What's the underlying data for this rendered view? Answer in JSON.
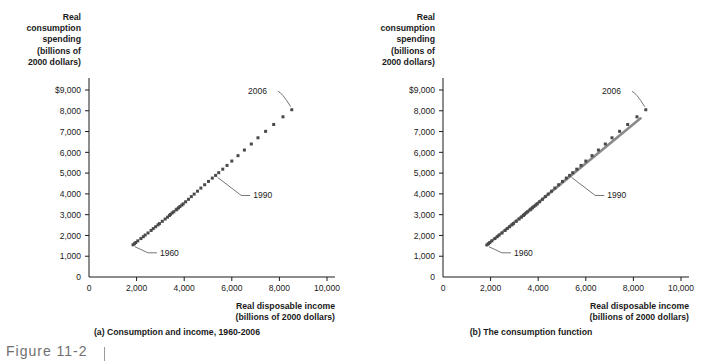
{
  "figure": {
    "number_label": "Figure 11-2"
  },
  "chart_data": [
    {
      "type": "scatter",
      "panel_id": "a",
      "title": "(a) Consumption and income, 1960-2006",
      "xlabel": "Real disposable income",
      "xlabel_units": "(billions of 2000 dollars)",
      "ylabel_lines": [
        "Real",
        "consumption",
        "spending",
        "(billions of",
        "2000 dollars)"
      ],
      "xlim": [
        0,
        10000
      ],
      "ylim": [
        0,
        9000
      ],
      "xticks": [
        0,
        2000,
        4000,
        6000,
        8000,
        10000
      ],
      "xtick_labels": [
        "0",
        "2,000",
        "4,000",
        "6,000",
        "8,000",
        "10,000"
      ],
      "yticks": [
        0,
        1000,
        2000,
        3000,
        4000,
        5000,
        6000,
        7000,
        8000,
        9000
      ],
      "ytick_labels": [
        "0",
        "1,000",
        "2,000",
        "3,000",
        "4,000",
        "5,000",
        "6,000",
        "7,000",
        "8,000",
        "$9,000"
      ],
      "grid": false,
      "legend": "none",
      "marker": "square",
      "marker_color": "#4a4a4a",
      "series": [
        {
          "name": "Real consumption spending vs. real disposable income, 1960-2006",
          "x": [
            1850,
            1910,
            1965,
            2050,
            2180,
            2280,
            2360,
            2480,
            2610,
            2700,
            2800,
            2900,
            2960,
            3080,
            3200,
            3300,
            3380,
            3420,
            3490,
            3560,
            3660,
            3700,
            3760,
            3820,
            3900,
            3960,
            4060,
            4180,
            4300,
            4420,
            4560,
            4700,
            4860,
            5020,
            5180,
            5320,
            5450,
            5620,
            5800,
            6000,
            6260,
            6530,
            6820,
            7100,
            7420,
            7760,
            8150,
            8520
          ],
          "y": [
            1550,
            1600,
            1660,
            1740,
            1850,
            1940,
            2020,
            2120,
            2240,
            2330,
            2420,
            2510,
            2570,
            2680,
            2790,
            2880,
            2960,
            3010,
            3080,
            3140,
            3230,
            3270,
            3330,
            3390,
            3460,
            3520,
            3620,
            3740,
            3870,
            3990,
            4130,
            4280,
            4440,
            4600,
            4760,
            4890,
            5020,
            5190,
            5370,
            5580,
            5840,
            6110,
            6400,
            6700,
            7010,
            7340,
            7710,
            8050
          ]
        }
      ],
      "annotations": [
        {
          "label": "1960",
          "point_x": 1850,
          "point_y": 1550,
          "text_x": 2980,
          "text_y": 1020
        },
        {
          "label": "1990",
          "point_x": 5320,
          "point_y": 4890,
          "text_x": 6900,
          "text_y": 3780
        },
        {
          "label": "2006",
          "point_x": 8520,
          "point_y": 8050,
          "text_x": 6680,
          "text_y": 8790
        }
      ],
      "fit_line": null
    },
    {
      "type": "scatter",
      "panel_id": "b",
      "title": "(b)  The consumption function",
      "xlabel": "Real disposable income",
      "xlabel_units": "(billions of 2000 dollars)",
      "ylabel_lines": [
        "Real",
        "consumption",
        "spending",
        "(billions of",
        "2000 dollars)"
      ],
      "xlim": [
        0,
        10000
      ],
      "ylim": [
        0,
        9000
      ],
      "xticks": [
        0,
        2000,
        4000,
        6000,
        8000,
        10000
      ],
      "xtick_labels": [
        "0",
        "2,000",
        "4,000",
        "6,000",
        "8,000",
        "10,000"
      ],
      "yticks": [
        0,
        1000,
        2000,
        3000,
        4000,
        5000,
        6000,
        7000,
        8000,
        9000
      ],
      "ytick_labels": [
        "0",
        "1,000",
        "2,000",
        "3,000",
        "4,000",
        "5,000",
        "6,000",
        "7,000",
        "8,000",
        "$9,000"
      ],
      "grid": false,
      "legend": "none",
      "marker": "square",
      "marker_color": "#4a4a4a",
      "series": [
        {
          "name": "Real consumption spending vs. real disposable income, 1960-2006",
          "x": [
            1850,
            1910,
            1965,
            2050,
            2180,
            2280,
            2360,
            2480,
            2610,
            2700,
            2800,
            2900,
            2960,
            3080,
            3200,
            3300,
            3380,
            3420,
            3490,
            3560,
            3660,
            3700,
            3760,
            3820,
            3900,
            3960,
            4060,
            4180,
            4300,
            4420,
            4560,
            4700,
            4860,
            5020,
            5180,
            5320,
            5450,
            5620,
            5800,
            6000,
            6260,
            6530,
            6820,
            7100,
            7420,
            7760,
            8150,
            8520
          ],
          "y": [
            1550,
            1600,
            1660,
            1740,
            1850,
            1940,
            2020,
            2120,
            2240,
            2330,
            2420,
            2510,
            2570,
            2680,
            2790,
            2880,
            2960,
            3010,
            3080,
            3140,
            3230,
            3270,
            3330,
            3390,
            3460,
            3520,
            3620,
            3740,
            3870,
            3990,
            4130,
            4280,
            4440,
            4600,
            4760,
            4890,
            5020,
            5190,
            5370,
            5580,
            5840,
            6110,
            6400,
            6700,
            7010,
            7340,
            7710,
            8050
          ]
        }
      ],
      "annotations": [
        {
          "label": "1960",
          "point_x": 1850,
          "point_y": 1550,
          "text_x": 2980,
          "text_y": 1020
        },
        {
          "label": "1990",
          "point_x": 5320,
          "point_y": 4890,
          "text_x": 6900,
          "text_y": 3780
        },
        {
          "label": "2006",
          "point_x": 8520,
          "point_y": 8050,
          "text_x": 6680,
          "text_y": 8790
        }
      ],
      "fit_line": {
        "name": "consumption function",
        "color": "#8a8a8a",
        "x1": 1830,
        "y1": 1530,
        "x2": 8300,
        "y2": 7640
      }
    }
  ]
}
